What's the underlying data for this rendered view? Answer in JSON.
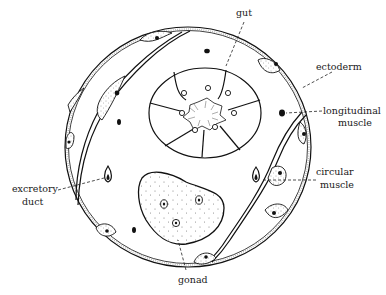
{
  "figure": {
    "colors": {
      "ink": "#111111",
      "background": "#ffffff"
    }
  },
  "labels": {
    "gut": "gut",
    "ectoderm": "ectoderm",
    "longitudinal_muscle_line1": "longitudinal",
    "longitudinal_muscle_line2": "muscle",
    "circular_muscle_line1": "circular",
    "circular_muscle_line2": "muscle",
    "excretory_duct_line1": "excretory",
    "excretory_duct_line2": "duct",
    "gonad": "gonad"
  }
}
